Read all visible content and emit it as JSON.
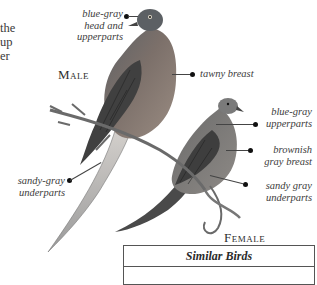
{
  "body_text_fragments": [
    "the",
    "up",
    "er"
  ],
  "male": {
    "title": "Male",
    "labels": {
      "head": [
        "blue-gray",
        "head and",
        "upperparts"
      ],
      "breast": "tawny breast",
      "underparts": [
        "sandy-gray",
        "underparts"
      ]
    }
  },
  "female": {
    "title": "Female",
    "labels": {
      "upperparts": [
        "blue-gray",
        "upperparts"
      ],
      "breast": [
        "brownish",
        "gray breast"
      ],
      "underparts": [
        "sandy gray",
        "underparts"
      ]
    }
  },
  "similar_birds": {
    "header": "Similar Birds"
  },
  "colors": {
    "background": "#ffffff",
    "text": "#3c3c3c",
    "male_head": "#6f7478",
    "male_breast": "#8a7a70",
    "female_body": "#7d7a76",
    "wing_dark": "#3d3d3d",
    "branch": "#6a6a6a"
  }
}
